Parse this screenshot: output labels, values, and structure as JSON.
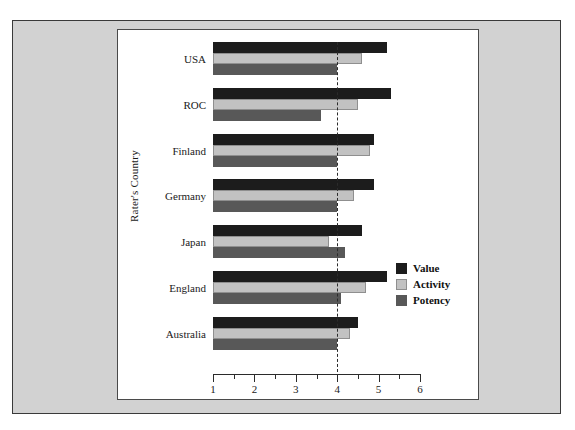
{
  "chart_data": {
    "type": "bar",
    "orientation": "horizontal",
    "title": "",
    "xlabel": "",
    "ylabel": "Rater's Country",
    "categories": [
      "USA",
      "ROC",
      "Finland",
      "Germany",
      "Japan",
      "England",
      "Australia"
    ],
    "series": [
      {
        "name": "Value",
        "color": "#1c1c1c",
        "values": [
          5.2,
          5.3,
          4.9,
          4.9,
          4.6,
          5.2,
          4.5
        ]
      },
      {
        "name": "Activity",
        "color": "#c2c2c2",
        "values": [
          4.6,
          4.5,
          4.8,
          4.4,
          3.8,
          4.7,
          4.3
        ]
      },
      {
        "name": "Potency",
        "color": "#585858",
        "values": [
          4.0,
          3.6,
          4.0,
          4.0,
          4.2,
          4.1,
          4.0
        ]
      }
    ],
    "xlim": [
      1,
      6
    ],
    "xticks": [
      1,
      2,
      3,
      4,
      5,
      6
    ],
    "xtick_labels": [
      "1",
      "2",
      "3",
      "4",
      "5",
      "6"
    ],
    "minor_ticks": [
      1.5,
      2.5,
      3.5,
      4.5,
      5.5
    ],
    "reference_line": {
      "value": 4,
      "style": "dashed",
      "color": "#2b2b2b"
    },
    "grid": false,
    "legend": {
      "position": "inside-right-lower",
      "entries": [
        "Value",
        "Activity",
        "Potency"
      ]
    }
  },
  "colors": {
    "value": "#1c1c1c",
    "activity": "#c2c2c2",
    "potency": "#585858",
    "card_background": "#d2d2d2",
    "panel_background": "#ffffff",
    "axis": "#2b2b2b"
  }
}
